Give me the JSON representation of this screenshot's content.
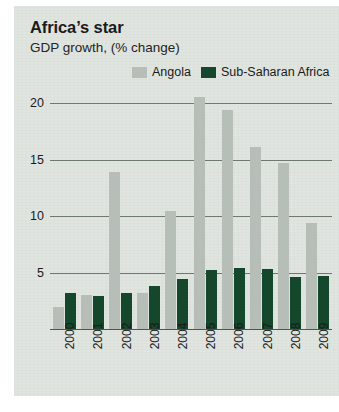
{
  "chart_data": {
    "type": "bar",
    "title": "Africa’s star",
    "subtitle": "GDP growth, (% change)",
    "xlabel": "",
    "ylabel": "",
    "ylim": [
      0,
      20
    ],
    "yticks": [
      0,
      5,
      10,
      15,
      20
    ],
    "ytick_labels": [
      "0",
      "5",
      "10",
      "15",
      "20"
    ],
    "grid": true,
    "legend_position": "top-right",
    "categories": [
      "2000",
      "2001",
      "2002",
      "2003",
      "2004",
      "2005",
      "2006",
      "2007",
      "2008",
      "2009"
    ],
    "series": [
      {
        "name": "Angola",
        "color": "#b7beb8",
        "values": [
          2.0,
          3.1,
          14.0,
          3.3,
          10.5,
          20.6,
          19.5,
          16.2,
          14.8,
          9.5
        ]
      },
      {
        "name": "Sub-Saharan Africa",
        "color": "#14472c",
        "values": [
          3.3,
          3.0,
          3.3,
          3.9,
          4.5,
          5.3,
          5.5,
          5.4,
          4.7,
          4.8
        ]
      }
    ]
  },
  "legend": {
    "items": [
      {
        "label": "Angola",
        "swatch": "#b7beb8"
      },
      {
        "label": "Sub-Saharan Africa",
        "swatch": "#14472c"
      }
    ]
  },
  "colors": {
    "panel_background": "#dde2dd",
    "page_background": "#ffffff",
    "gridline": "#6e7a70",
    "baseline": "#4d574f",
    "text": "#1b1b1b",
    "angola": "#b7beb8",
    "sub_saharan_africa": "#14472c"
  }
}
